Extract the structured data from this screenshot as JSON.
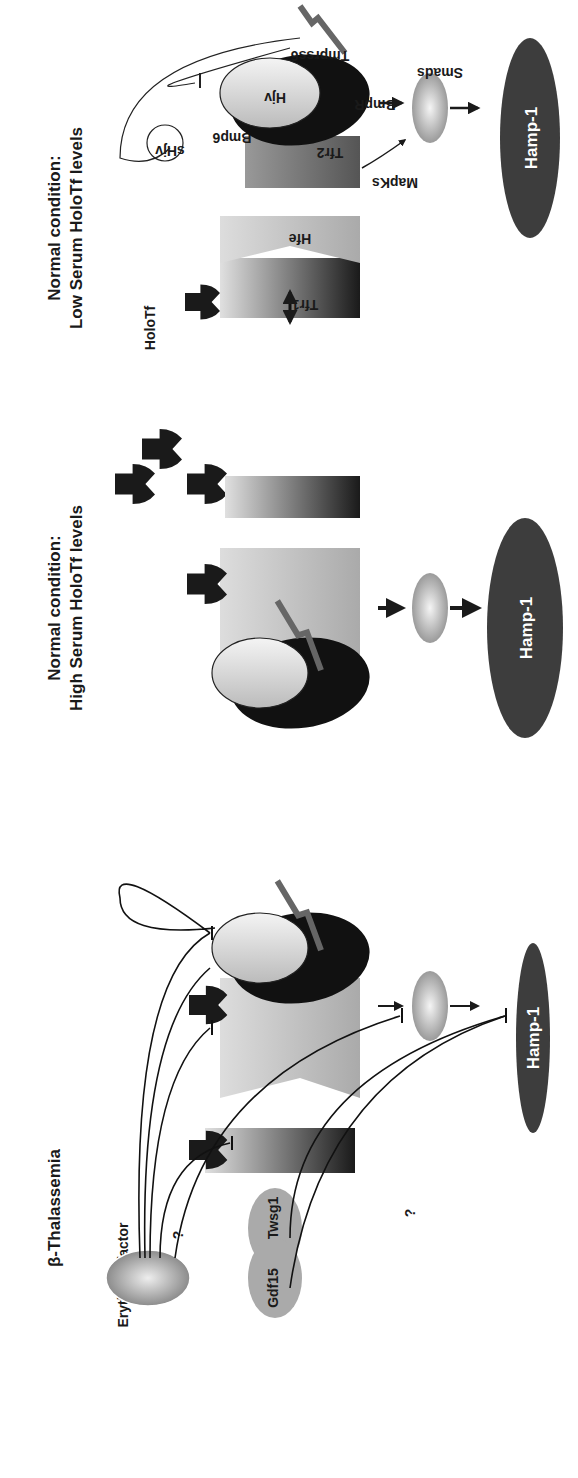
{
  "panels": {
    "low": {
      "title_line1": "Normal condition:",
      "title_line2": "Low Serum HoloTf levels",
      "labels": {
        "holotf": "HoloTf",
        "tfr1": "Tfr1",
        "hfe": "Hfe",
        "tfr2": "Tfr2",
        "mapks": "MapKs",
        "bmp6": "Bmp6",
        "shjv": "sHjv",
        "hjv": "Hjv",
        "bmpr": "BmpR",
        "tmprss6": "Tmprss6",
        "smads": "Smads",
        "hamp": "Hamp-1"
      }
    },
    "high": {
      "title_line1": "Normal condition:",
      "title_line2": "High Serum HoloTf levels",
      "labels": {
        "hamp": "Hamp-1"
      }
    },
    "thal": {
      "title": "β-Thalassemia",
      "labels": {
        "erythroid": "Erythroid factor",
        "question1": "?",
        "question2": "?",
        "twsg1": "Twsg1",
        "gdf15": "Gdf15",
        "hamp": "Hamp-1"
      }
    }
  },
  "colors": {
    "dark": "#1a1a1a",
    "hamp_fill": "#3d3d3d",
    "mid_gray": "#8a8a8a",
    "light_gray": "#d8d8d8"
  }
}
